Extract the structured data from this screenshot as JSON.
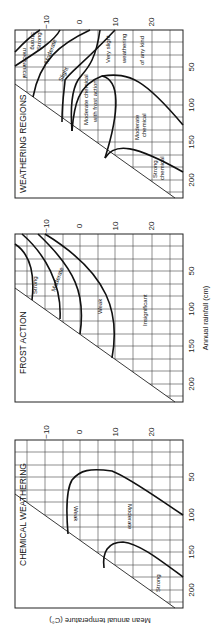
{
  "figure": {
    "orientation": "rotated 90 degrees counter-clockwise",
    "x_axis_label": "Annual rainfall (cm)",
    "y_axis_label": "Mean annual temperature (C°)",
    "rainfall_ticks": [
      "50",
      "100",
      "150",
      "200"
    ],
    "temperature_ticks": [
      "−10",
      "0",
      "10",
      "20"
    ]
  },
  "panels": [
    {
      "id": "weathering-regions",
      "title": "WEATHERING REGIONS",
      "regions": [
        {
          "label": "Strong mechanical"
        },
        {
          "label": "Moderate mechanical"
        },
        {
          "label": "Slight mechanical"
        },
        {
          "label": "Moderate chemical with frost action"
        },
        {
          "label": "Very slight weathering of any kind"
        },
        {
          "label": "Moderate chemical"
        },
        {
          "label": "Strong chemical"
        }
      ]
    },
    {
      "id": "frost-action",
      "title": "FROST ACTION",
      "regions": [
        {
          "label": "Strong"
        },
        {
          "label": "Moderate"
        },
        {
          "label": "Weak"
        },
        {
          "label": "Insignificant"
        }
      ]
    },
    {
      "id": "chemical-weathering",
      "title": "CHEMICAL WEATHERING",
      "regions": [
        {
          "label": "Weak"
        },
        {
          "label": "Moderate"
        },
        {
          "label": "Strong"
        }
      ]
    }
  ],
  "labels": {
    "p1_title": "WEATHERING REGIONS",
    "p1_strong_mech_1": "Strong",
    "p1_strong_mech_2": "mechanical",
    "p1_mod_mech_1": "Moderate",
    "p1_mod_mech_2": "mechanical",
    "p1_slight_mech_1": "Slight",
    "p1_slight_mech_2": "mechanical",
    "p1_mcfa_1": "Moderate chemical",
    "p1_mcfa_2": "with frost action",
    "p1_vs_1": "Very slight",
    "p1_vs_2": "weathering",
    "p1_vs_3": "of any kind",
    "p1_modchem_1": "Moderate",
    "p1_modchem_2": "chemical",
    "p1_strongchem_1": "Strong",
    "p1_strongchem_2": "chemical",
    "p2_title": "FROST ACTION",
    "p2_strong": "Strong",
    "p2_moderate": "Moderate",
    "p2_weak": "Weak",
    "p2_insignificant": "Insignificant",
    "p3_title": "CHEMICAL WEATHERING",
    "p3_weak": "Weak",
    "p3_moderate": "Moderate",
    "p3_strong": "Strong",
    "t_m10": "−10",
    "t_0": "0",
    "t_10": "10",
    "t_20": "20",
    "r_50": "50",
    "r_100": "100",
    "r_150": "150",
    "r_200": "200",
    "x_axis": "Annual rainfall (cm)",
    "y_axis": "Mean annual temperature (C°)"
  }
}
